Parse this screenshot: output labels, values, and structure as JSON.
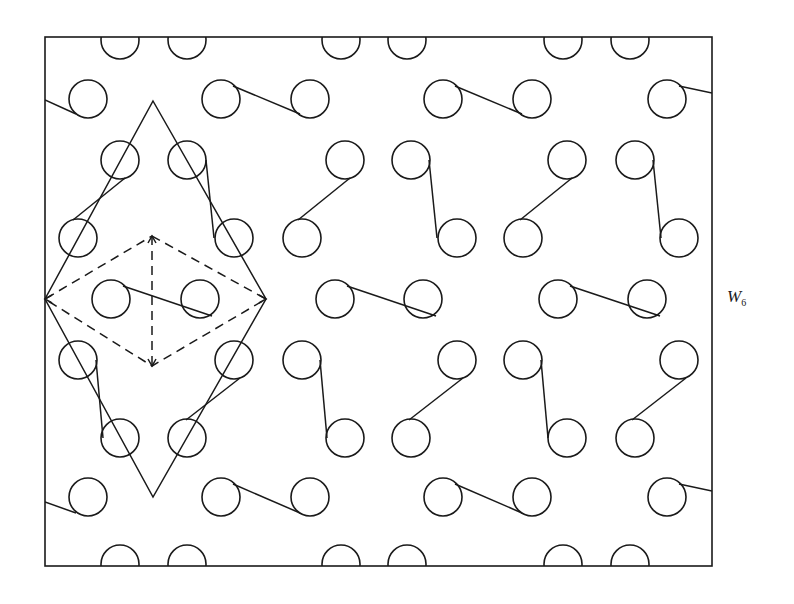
{
  "figure": {
    "label_main": "W",
    "label_sub": "6",
    "stroke_color": "#1a1a1a",
    "background": "#ffffff",
    "frame": {
      "x1": 45,
      "y1": 37,
      "x2": 712,
      "y2": 566
    },
    "circle_radius": 19,
    "circles": [
      [
        120,
        40
      ],
      [
        187,
        40
      ],
      [
        341,
        40
      ],
      [
        407,
        40
      ],
      [
        563,
        40
      ],
      [
        630,
        40
      ],
      [
        88,
        99
      ],
      [
        221,
        99
      ],
      [
        310,
        99
      ],
      [
        443,
        99
      ],
      [
        532,
        99
      ],
      [
        667,
        99
      ],
      [
        120,
        160
      ],
      [
        187,
        160
      ],
      [
        345,
        160
      ],
      [
        411,
        160
      ],
      [
        567,
        160
      ],
      [
        635,
        160
      ],
      [
        78,
        238
      ],
      [
        234,
        238
      ],
      [
        302,
        238
      ],
      [
        457,
        238
      ],
      [
        523,
        238
      ],
      [
        679,
        238
      ],
      [
        111,
        299
      ],
      [
        200,
        299
      ],
      [
        335,
        299
      ],
      [
        423,
        299
      ],
      [
        558,
        299
      ],
      [
        647,
        299
      ],
      [
        78,
        360
      ],
      [
        234,
        360
      ],
      [
        302,
        360
      ],
      [
        457,
        360
      ],
      [
        523,
        360
      ],
      [
        679,
        360
      ],
      [
        120,
        438
      ],
      [
        187,
        438
      ],
      [
        345,
        438
      ],
      [
        411,
        438
      ],
      [
        567,
        438
      ],
      [
        635,
        438
      ],
      [
        88,
        497
      ],
      [
        221,
        497
      ],
      [
        310,
        497
      ],
      [
        443,
        497
      ],
      [
        532,
        497
      ],
      [
        667,
        497
      ],
      [
        120,
        564
      ],
      [
        187,
        564
      ],
      [
        341,
        564
      ],
      [
        407,
        564
      ],
      [
        563,
        564
      ],
      [
        630,
        564
      ]
    ],
    "links": [
      [
        45,
        100,
        76,
        114
      ],
      [
        233,
        86,
        300,
        114
      ],
      [
        455,
        86,
        522,
        114
      ],
      [
        679,
        86,
        712,
        93
      ],
      [
        125,
        178,
        73,
        220
      ],
      [
        206,
        160,
        214,
        238
      ],
      [
        350,
        178,
        298,
        220
      ],
      [
        429,
        160,
        437,
        238
      ],
      [
        572,
        178,
        520,
        220
      ],
      [
        653,
        160,
        661,
        238
      ],
      [
        123,
        286,
        212,
        316
      ],
      [
        347,
        286,
        436,
        316
      ],
      [
        570,
        286,
        660,
        316
      ],
      [
        96,
        360,
        103,
        438
      ],
      [
        240,
        378,
        186,
        420
      ],
      [
        320,
        360,
        327,
        438
      ],
      [
        463,
        378,
        409,
        420
      ],
      [
        541,
        360,
        548,
        438
      ],
      [
        686,
        378,
        632,
        420
      ],
      [
        45,
        502,
        76,
        513
      ],
      [
        233,
        484,
        300,
        513
      ],
      [
        455,
        484,
        522,
        513
      ],
      [
        679,
        484,
        712,
        491
      ]
    ],
    "unit_cell": {
      "solid_diamond": [
        [
          153,
          101
        ],
        [
          266,
          299
        ],
        [
          153,
          497
        ],
        [
          45,
          299
        ]
      ],
      "dashed_diamond": [
        [
          152,
          236
        ],
        [
          266,
          299
        ],
        [
          152,
          366
        ],
        [
          45,
          299
        ]
      ],
      "dashed_axis": [
        [
          152,
          236
        ],
        [
          152,
          366
        ]
      ],
      "arrow_points": [
        [
          45,
          299
        ],
        [
          266,
          299
        ],
        [
          152,
          236
        ],
        [
          152,
          366
        ]
      ]
    }
  }
}
